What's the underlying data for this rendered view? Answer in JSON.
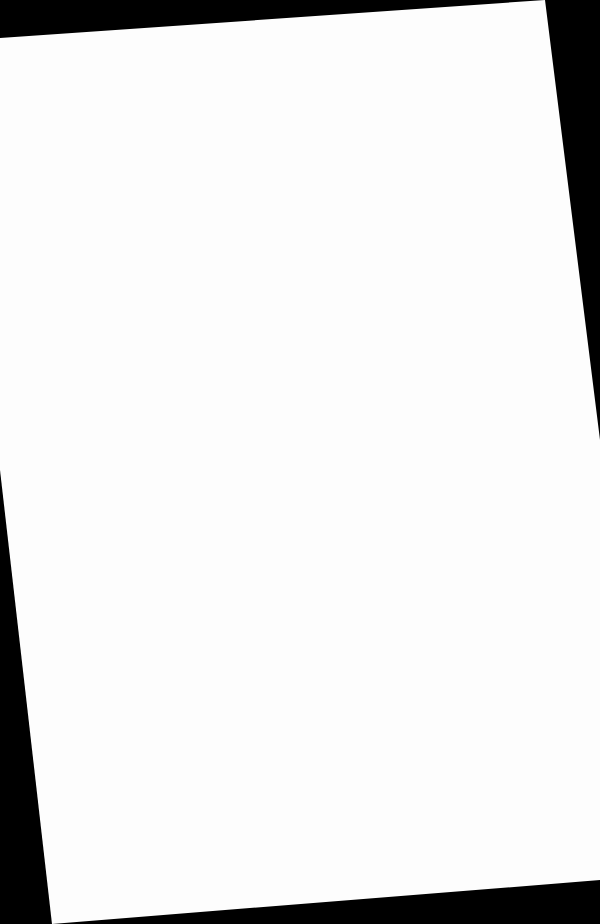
{
  "document": {
    "type": "scanned-page",
    "content": "blank",
    "background_color": "#000000",
    "page_color": "#fdfdfd",
    "rotation_deg": -6,
    "bleed_through_text": ""
  }
}
